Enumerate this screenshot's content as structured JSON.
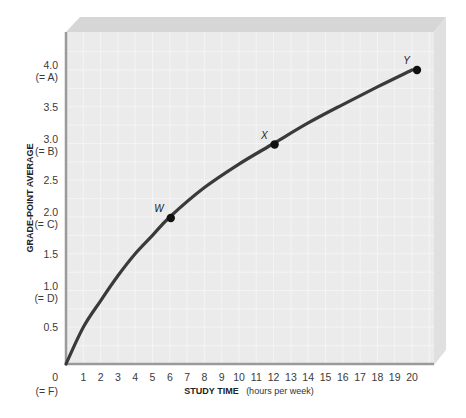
{
  "chart_data": {
    "type": "line",
    "title": "",
    "xlabel": "STUDY TIME",
    "xlabel_unit": "(hours per week)",
    "ylabel": "GRADE-POINT AVERAGE",
    "xlim": [
      0,
      20
    ],
    "ylim": [
      0,
      4.0
    ],
    "grid": true,
    "x_ticks": [
      "1",
      "2",
      "3",
      "4",
      "5",
      "6",
      "7",
      "8",
      "9",
      "10",
      "11",
      "12",
      "13",
      "14",
      "15",
      "16",
      "17",
      "18",
      "19",
      "20"
    ],
    "y_ticks": [
      {
        "value": 4.0,
        "label": "4.0",
        "sub": "(= A)"
      },
      {
        "value": 3.5,
        "label": "3.5",
        "sub": ""
      },
      {
        "value": 3.0,
        "label": "3.0",
        "sub": "(= B)"
      },
      {
        "value": 2.5,
        "label": "2.5",
        "sub": ""
      },
      {
        "value": 2.0,
        "label": "2.0",
        "sub": "(= C)"
      },
      {
        "value": 1.5,
        "label": "1.5",
        "sub": ""
      },
      {
        "value": 1.0,
        "label": "1.0",
        "sub": "(= D)"
      },
      {
        "value": 0.5,
        "label": "0.5",
        "sub": ""
      },
      {
        "value": 0,
        "label": "0",
        "sub": "(= F)"
      }
    ],
    "series": [
      {
        "name": "GPA vs study time",
        "x": [
          0,
          1,
          2,
          3,
          4,
          5,
          6,
          8,
          10,
          12,
          14,
          16,
          18,
          20
        ],
        "values": [
          0,
          0.5,
          0.86,
          1.2,
          1.5,
          1.75,
          2.0,
          2.4,
          2.72,
          3.0,
          3.28,
          3.53,
          3.77,
          4.0
        ]
      }
    ],
    "points": [
      {
        "label": "W",
        "x": 6,
        "y": 2.0
      },
      {
        "label": "X",
        "x": 12,
        "y": 3.0
      },
      {
        "label": "Y",
        "x": 20,
        "y": 4.0
      }
    ],
    "colors": {
      "curve": "#3a3a3a",
      "face": "#ececec",
      "top_face": "#d9d9d9",
      "side_face": "#e2e2e2",
      "axis": "#9a9a9a"
    }
  }
}
